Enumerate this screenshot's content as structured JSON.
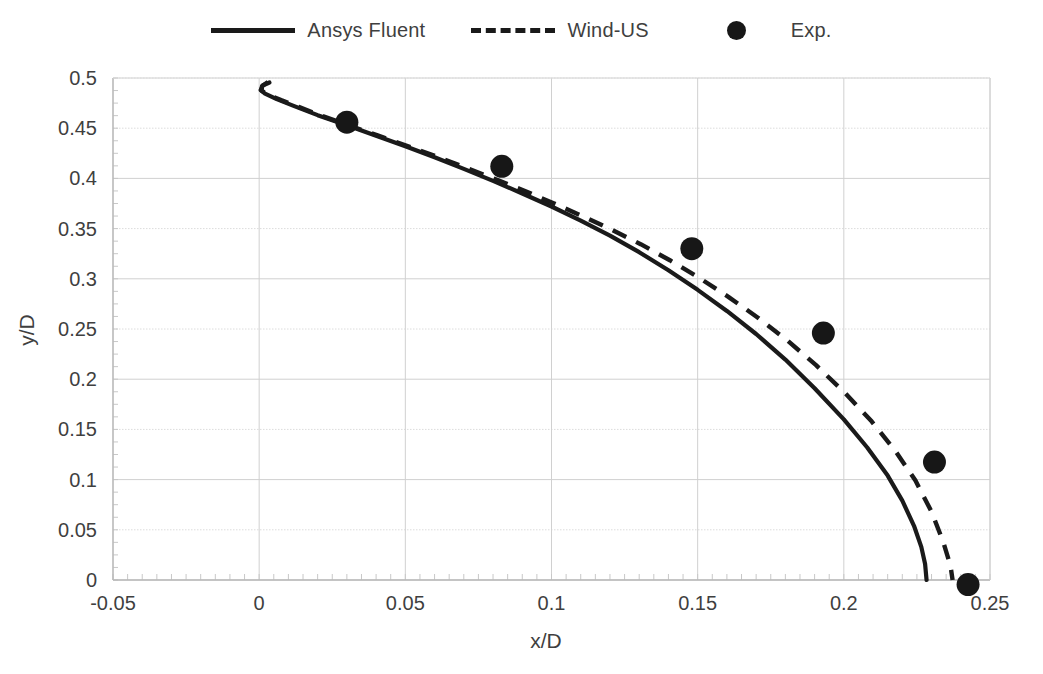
{
  "chart_data": {
    "type": "line",
    "title": "",
    "xlabel": "x/D",
    "ylabel": "y/D",
    "xlim": [
      -0.05,
      0.25
    ],
    "ylim": [
      0,
      0.5
    ],
    "xticks": [
      "-0.05",
      "0",
      "0.05",
      "0.1",
      "0.15",
      "0.2",
      "0.25"
    ],
    "xtick_values": [
      -0.05,
      0,
      0.05,
      0.1,
      0.15,
      0.2,
      0.25
    ],
    "yticks": [
      "0",
      "0.05",
      "0.1",
      "0.15",
      "0.2",
      "0.25",
      "0.3",
      "0.35",
      "0.4",
      "0.45",
      "0.5"
    ],
    "ytick_values": [
      0,
      0.05,
      0.1,
      0.15,
      0.2,
      0.25,
      0.3,
      0.35,
      0.4,
      0.45,
      0.5
    ],
    "grid": true,
    "legend_position": "top-center",
    "series": [
      {
        "name": "Ansys Fluent",
        "style": "solid",
        "color": "#1a1a1a",
        "points": [
          [
            0.0035,
            0.4955
          ],
          [
            0.0012,
            0.4925
          ],
          [
            0.0005,
            0.488
          ],
          [
            0.002,
            0.4845
          ],
          [
            0.006,
            0.479
          ],
          [
            0.012,
            0.472
          ],
          [
            0.02,
            0.463
          ],
          [
            0.03,
            0.453
          ],
          [
            0.04,
            0.4425
          ],
          [
            0.05,
            0.432
          ],
          [
            0.06,
            0.421
          ],
          [
            0.07,
            0.4095
          ],
          [
            0.08,
            0.3975
          ],
          [
            0.09,
            0.385
          ],
          [
            0.1,
            0.372
          ],
          [
            0.11,
            0.358
          ],
          [
            0.12,
            0.343
          ],
          [
            0.13,
            0.3265
          ],
          [
            0.14,
            0.3085
          ],
          [
            0.15,
            0.289
          ],
          [
            0.16,
            0.268
          ],
          [
            0.17,
            0.245
          ],
          [
            0.18,
            0.2195
          ],
          [
            0.19,
            0.191
          ],
          [
            0.2,
            0.16
          ],
          [
            0.208,
            0.132
          ],
          [
            0.215,
            0.104
          ],
          [
            0.22,
            0.079
          ],
          [
            0.224,
            0.054
          ],
          [
            0.2265,
            0.033
          ],
          [
            0.2278,
            0.016
          ],
          [
            0.2283,
            0.0
          ]
        ]
      },
      {
        "name": "Wind-US",
        "style": "dashed",
        "color": "#1a1a1a",
        "points": [
          [
            0.003,
            0.496
          ],
          [
            0.001,
            0.492
          ],
          [
            0.0008,
            0.4875
          ],
          [
            0.003,
            0.4835
          ],
          [
            0.0075,
            0.478
          ],
          [
            0.0135,
            0.4712
          ],
          [
            0.021,
            0.4628
          ],
          [
            0.0305,
            0.453
          ],
          [
            0.0405,
            0.4428
          ],
          [
            0.0505,
            0.4325
          ],
          [
            0.0605,
            0.422
          ],
          [
            0.0705,
            0.411
          ],
          [
            0.0805,
            0.3995
          ],
          [
            0.0905,
            0.388
          ],
          [
            0.1005,
            0.3755
          ],
          [
            0.1105,
            0.3625
          ],
          [
            0.1205,
            0.349
          ],
          [
            0.1305,
            0.3345
          ],
          [
            0.1405,
            0.3185
          ],
          [
            0.1505,
            0.301
          ],
          [
            0.1605,
            0.282
          ],
          [
            0.1705,
            0.2615
          ],
          [
            0.1805,
            0.239
          ],
          [
            0.1905,
            0.214
          ],
          [
            0.2005,
            0.186
          ],
          [
            0.2095,
            0.158
          ],
          [
            0.2175,
            0.129
          ],
          [
            0.2245,
            0.099
          ],
          [
            0.23,
            0.068
          ],
          [
            0.234,
            0.038
          ],
          [
            0.2365,
            0.014
          ],
          [
            0.2372,
            0.0
          ]
        ]
      }
    ],
    "scatter": {
      "name": "Exp.",
      "marker": "circle",
      "color": "#171717",
      "points": [
        [
          0.03,
          0.456
        ],
        [
          0.083,
          0.412
        ],
        [
          0.148,
          0.33
        ],
        [
          0.193,
          0.246
        ],
        [
          0.231,
          0.1175
        ],
        [
          0.2425,
          -0.0045
        ]
      ]
    }
  },
  "legend": {
    "items": [
      {
        "label": "Ansys Fluent",
        "swatch": "solid-line-swatch"
      },
      {
        "label": "Wind-US",
        "swatch": "dashed-line-swatch"
      },
      {
        "label": "Exp.",
        "swatch": "circle-marker-swatch"
      }
    ]
  }
}
